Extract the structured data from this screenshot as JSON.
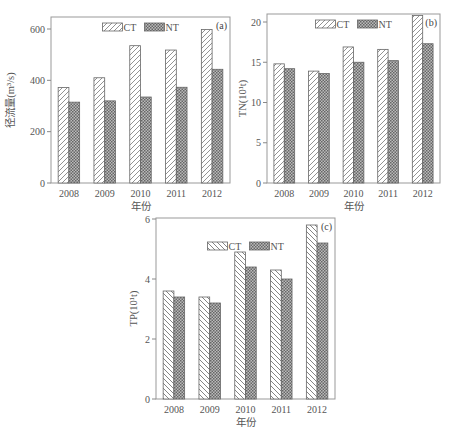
{
  "chart_data": [
    {
      "type": "bar",
      "panel_label": "(a)",
      "title": "",
      "xlabel": "年份",
      "ylabel": "径流量(m³/s)",
      "categories": [
        "2008",
        "2009",
        "2010",
        "2011",
        "2012"
      ],
      "series": [
        {
          "name": "CT",
          "pattern": "diagonal-forward",
          "values": [
            372,
            410,
            535,
            518,
            598
          ]
        },
        {
          "name": "NT",
          "pattern": "crosshatch",
          "values": [
            315,
            320,
            335,
            373,
            443
          ]
        }
      ],
      "ylim": [
        0,
        620
      ],
      "yticks": [
        0,
        200,
        400,
        600
      ],
      "grid": false,
      "legend_position": "top-center"
    },
    {
      "type": "bar",
      "panel_label": "(b)",
      "title": "",
      "xlabel": "年份",
      "ylabel": "TN(10¹t)",
      "categories": [
        "2008",
        "2009",
        "2010",
        "2011",
        "2012"
      ],
      "series": [
        {
          "name": "CT",
          "pattern": "diagonal-forward",
          "values": [
            14.8,
            13.9,
            16.9,
            16.6,
            20.8
          ]
        },
        {
          "name": "NT",
          "pattern": "crosshatch",
          "values": [
            14.2,
            13.6,
            15.0,
            15.2,
            17.3
          ]
        }
      ],
      "ylim": [
        0,
        21
      ],
      "yticks": [
        0,
        5,
        10,
        15,
        20
      ],
      "grid": false,
      "legend_position": "top-center"
    },
    {
      "type": "bar",
      "panel_label": "(c)",
      "title": "",
      "xlabel": "年份",
      "ylabel": "TP(10¹t)",
      "categories": [
        "2008",
        "2009",
        "2010",
        "2011",
        "2012"
      ],
      "series": [
        {
          "name": "CT",
          "pattern": "diagonal-backward",
          "values": [
            3.6,
            3.4,
            4.9,
            4.3,
            5.8
          ]
        },
        {
          "name": "NT",
          "pattern": "crosshatch",
          "values": [
            3.4,
            3.2,
            4.4,
            4.0,
            5.2
          ]
        }
      ],
      "ylim": [
        0,
        6
      ],
      "yticks": [
        0,
        2,
        4,
        6
      ],
      "grid": false,
      "legend_position": "top-center"
    }
  ],
  "panels": [
    {
      "label": "(a)",
      "ylabel": "径流量(m³/s)",
      "xlabel": "年份",
      "legend": [
        "CT",
        "NT"
      ]
    },
    {
      "label": "(b)",
      "ylabel": "TN(10¹t)",
      "xlabel": "年份",
      "legend": [
        "CT",
        "NT"
      ]
    },
    {
      "label": "(c)",
      "ylabel": "TP(10¹t)",
      "xlabel": "年份",
      "legend": [
        "CT",
        "NT"
      ]
    }
  ]
}
